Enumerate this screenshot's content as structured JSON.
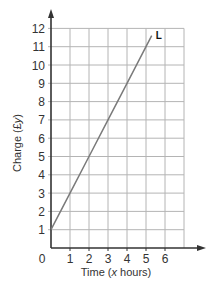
{
  "chart_data": {
    "type": "line",
    "title": "",
    "xlabel": "Time (x hours)",
    "xlabel_parts": [
      "Time (",
      "x",
      " hours)"
    ],
    "ylabel": "Charge (£y)",
    "ylabel_parts": [
      "Charge (£",
      "y",
      ")"
    ],
    "xlim": [
      0,
      7
    ],
    "ylim": [
      0,
      12
    ],
    "x_ticks": [
      0,
      1,
      2,
      3,
      4,
      5,
      6
    ],
    "y_ticks": [
      1,
      2,
      3,
      4,
      5,
      6,
      7,
      8,
      9,
      10,
      11,
      12
    ],
    "grid": true,
    "series": [
      {
        "name": "L",
        "x": [
          0,
          1,
          2,
          3,
          4,
          5,
          5.3
        ],
        "y": [
          1,
          3,
          5,
          7,
          9,
          11,
          11.6
        ],
        "equation": "y = 2x + 1"
      }
    ],
    "legend": {
      "position": "inline-end-label"
    }
  },
  "colors": {
    "grid": "#b4b4b4",
    "axis": "#333333",
    "series_line": "#7a7a7a"
  }
}
